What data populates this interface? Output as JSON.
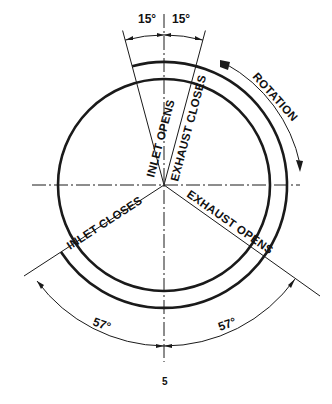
{
  "diagram": {
    "type": "valve-timing-diagram",
    "labels": {
      "inlet_opens": "INLET OPENS",
      "exhaust_closes": "EXHAUST CLOSES",
      "inlet_closes": "INLET CLOSES",
      "exhaust_opens": "EXHAUST OPENS",
      "rotation": "ROTATION"
    },
    "angles": {
      "top_left": "15°",
      "top_right": "15°",
      "bottom_left": "57°",
      "bottom_right": "57°"
    },
    "page_number": "5",
    "colors": {
      "ink": "#1a1a1a",
      "background": "#ffffff"
    }
  }
}
